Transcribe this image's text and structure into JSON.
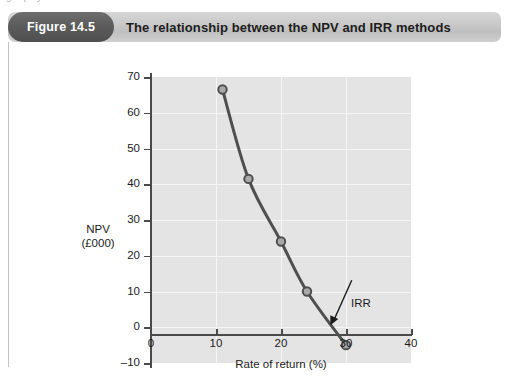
{
  "page": {
    "top_text_fragment": "graphy"
  },
  "figure": {
    "badge_label": "Figure 14.5",
    "title": "The relationship between the NPV and IRR methods"
  },
  "colors": {
    "badge_background": "#5c5c5c",
    "header_background": "#c9c9c9",
    "plot_background": "#e4e4e4",
    "grid_line": "#f6f6f6",
    "axis": "#4a4a4a",
    "curve": "#4f4f4f",
    "marker_fill": "#a9a9a9",
    "card_border": "#c3c3c3",
    "text": "#1b1b1b"
  },
  "chart_data": {
    "type": "line",
    "title": "The relationship between the NPV and IRR methods",
    "subtitle": "",
    "xlabel": "Rate of return (%)",
    "ylabel": "NPV (£000)",
    "ylabel_lines": [
      "NPV",
      "(£000)"
    ],
    "xlim": [
      0,
      40
    ],
    "ylim": [
      -10,
      70
    ],
    "xticks": [
      0,
      10,
      20,
      30,
      40
    ],
    "xtick_labels": [
      "0",
      "10",
      "20",
      "30",
      "40"
    ],
    "yticks": [
      -10,
      0,
      10,
      20,
      30,
      40,
      50,
      60,
      70
    ],
    "ytick_labels": [
      "–10",
      "0",
      "10",
      "20",
      "30",
      "40",
      "50",
      "60",
      "70"
    ],
    "grid": true,
    "grid_color": "#f6f6f6",
    "legend": false,
    "legend_position": "none",
    "markers": "circle",
    "series": [
      {
        "name": "NPV",
        "x": [
          11,
          15,
          20,
          24,
          30
        ],
        "values": [
          66.5,
          41.5,
          24.0,
          10.0,
          -5.0
        ]
      }
    ],
    "annotations": [
      {
        "label": "IRR",
        "text_x": 31.5,
        "text_y": 14.0,
        "point_x": 27.6,
        "point_y": 0.0,
        "arrow": true
      }
    ]
  }
}
